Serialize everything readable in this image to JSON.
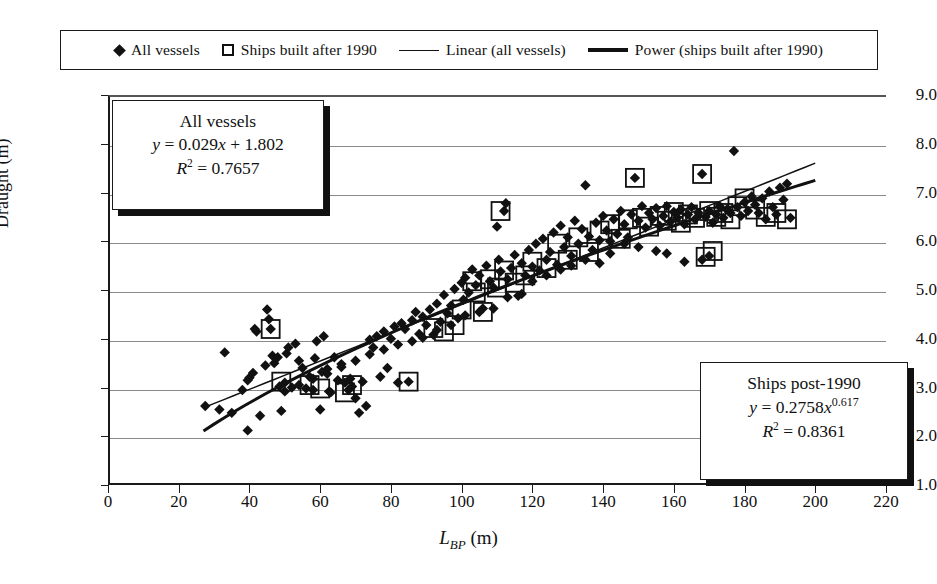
{
  "chart_data": {
    "type": "scatter",
    "title": "",
    "xlabel": "L_BP (m)",
    "xlabel_main": "L",
    "xlabel_sub": "BP",
    "xlabel_unit": " (m)",
    "ylabel": "Draught (m)",
    "xlim": [
      0,
      220
    ],
    "ylim": [
      1.0,
      9.0
    ],
    "xticks": [
      0,
      20,
      40,
      60,
      80,
      100,
      120,
      140,
      160,
      180,
      200,
      220
    ],
    "yticks": [
      "1.0",
      "2.0",
      "3.0",
      "4.0",
      "5.0",
      "6.0",
      "7.0",
      "8.0",
      "9.0"
    ],
    "grid": "horizontal",
    "legend_position": "top",
    "marker_color": "#111111",
    "gridline_color": "#8a8a8a",
    "axis_color": "#1a1a1a",
    "series": [
      {
        "name": "All vessels",
        "marker": "diamond",
        "points": [
          [
            27.5,
            2.62
          ],
          [
            31.5,
            2.55
          ],
          [
            33.0,
            3.72
          ],
          [
            35.0,
            2.48
          ],
          [
            38.0,
            2.95
          ],
          [
            39.5,
            3.15
          ],
          [
            39.5,
            2.12
          ],
          [
            40.0,
            3.2
          ],
          [
            41.0,
            3.3
          ],
          [
            41.5,
            4.2
          ],
          [
            42.0,
            4.15
          ],
          [
            43.0,
            2.42
          ],
          [
            44.5,
            3.45
          ],
          [
            45.0,
            4.6
          ],
          [
            45.5,
            4.4
          ],
          [
            46.0,
            4.2
          ],
          [
            46.5,
            3.65
          ],
          [
            47.0,
            3.5
          ],
          [
            48.0,
            3.62
          ],
          [
            48.5,
            3.02
          ],
          [
            49.0,
            2.52
          ],
          [
            50.0,
            3.1
          ],
          [
            50.5,
            3.7
          ],
          [
            51.0,
            3.82
          ],
          [
            52.0,
            3.0
          ],
          [
            53.0,
            3.9
          ],
          [
            54.0,
            3.55
          ],
          [
            55.0,
            3.4
          ],
          [
            56.0,
            2.98
          ],
          [
            57.0,
            3.22
          ],
          [
            58.0,
            2.95
          ],
          [
            58.5,
            3.6
          ],
          [
            59.0,
            3.95
          ],
          [
            60.0,
            2.55
          ],
          [
            60.5,
            3.32
          ],
          [
            61.0,
            4.05
          ],
          [
            62.0,
            3.38
          ],
          [
            62.5,
            2.92
          ],
          [
            63.0,
            2.9
          ],
          [
            64.0,
            3.62
          ],
          [
            65.0,
            3.15
          ],
          [
            66.0,
            3.48
          ],
          [
            67.0,
            3.1
          ],
          [
            68.0,
            2.95
          ],
          [
            68.5,
            3.18
          ],
          [
            69.0,
            3.02
          ],
          [
            70.0,
            2.78
          ],
          [
            71.0,
            2.48
          ],
          [
            72.0,
            3.12
          ],
          [
            73.0,
            2.62
          ],
          [
            74.0,
            3.98
          ],
          [
            75.0,
            3.82
          ],
          [
            76.0,
            4.05
          ],
          [
            77.0,
            3.22
          ],
          [
            78.0,
            4.15
          ],
          [
            79.0,
            3.4
          ],
          [
            80.0,
            4.0
          ],
          [
            81.0,
            4.25
          ],
          [
            82.0,
            3.1
          ],
          [
            83.0,
            4.32
          ],
          [
            84.0,
            4.2
          ],
          [
            85.0,
            3.12
          ],
          [
            86.0,
            4.38
          ],
          [
            87.0,
            4.55
          ],
          [
            88.0,
            4.1
          ],
          [
            89.0,
            4.45
          ],
          [
            90.0,
            4.28
          ],
          [
            91.0,
            4.6
          ],
          [
            92.0,
            4.08
          ],
          [
            93.0,
            4.72
          ],
          [
            94.0,
            4.35
          ],
          [
            95.0,
            4.9
          ],
          [
            96.0,
            4.52
          ],
          [
            97.0,
            4.68
          ],
          [
            98.0,
            5.02
          ],
          [
            99.0,
            4.42
          ],
          [
            100.0,
            5.15
          ],
          [
            100.5,
            4.8
          ],
          [
            101.0,
            5.25
          ],
          [
            102.0,
            4.95
          ],
          [
            103.0,
            5.42
          ],
          [
            104.0,
            5.1
          ],
          [
            105.0,
            5.3
          ],
          [
            106.0,
            4.62
          ],
          [
            107.0,
            5.5
          ],
          [
            108.0,
            5.18
          ],
          [
            109.0,
            5.05
          ],
          [
            110.0,
            6.3
          ],
          [
            110.5,
            5.62
          ],
          [
            111.0,
            5.38
          ],
          [
            112.0,
            6.62
          ],
          [
            112.5,
            6.78
          ],
          [
            113.0,
            5.22
          ],
          [
            114.0,
            5.45
          ],
          [
            115.0,
            5.72
          ],
          [
            116.0,
            4.88
          ],
          [
            117.0,
            5.55
          ],
          [
            118.0,
            5.3
          ],
          [
            119.0,
            5.82
          ],
          [
            120.0,
            5.48
          ],
          [
            121.0,
            5.95
          ],
          [
            122.0,
            5.4
          ],
          [
            123.0,
            6.05
          ],
          [
            124.0,
            5.62
          ],
          [
            125.0,
            5.78
          ],
          [
            126.0,
            6.18
          ],
          [
            127.0,
            5.52
          ],
          [
            128.0,
            6.32
          ],
          [
            129.0,
            5.88
          ],
          [
            130.0,
            6.08
          ],
          [
            131.0,
            5.7
          ],
          [
            132.0,
            6.42
          ],
          [
            133.0,
            5.95
          ],
          [
            134.0,
            6.25
          ],
          [
            135.0,
            7.15
          ],
          [
            136.0,
            6.1
          ],
          [
            137.0,
            5.82
          ],
          [
            138.0,
            6.38
          ],
          [
            139.0,
            6.02
          ],
          [
            140.0,
            6.52
          ],
          [
            141.0,
            6.22
          ],
          [
            142.0,
            5.75
          ],
          [
            143.0,
            6.45
          ],
          [
            144.0,
            6.15
          ],
          [
            145.0,
            6.62
          ],
          [
            146.0,
            6.35
          ],
          [
            147.0,
            6.08
          ],
          [
            148.0,
            6.55
          ],
          [
            149.0,
            7.3
          ],
          [
            150.0,
            6.42
          ],
          [
            151.0,
            6.72
          ],
          [
            152.0,
            6.28
          ],
          [
            153.0,
            6.58
          ],
          [
            154.0,
            6.45
          ],
          [
            155.0,
            6.68
          ],
          [
            156.0,
            6.32
          ],
          [
            157.0,
            6.52
          ],
          [
            158.0,
            6.72
          ],
          [
            159.0,
            6.4
          ],
          [
            160.0,
            6.6
          ],
          [
            161.0,
            6.48
          ],
          [
            162.0,
            6.65
          ],
          [
            163.0,
            6.35
          ],
          [
            164.0,
            6.55
          ],
          [
            165.0,
            6.7
          ],
          [
            166.0,
            6.45
          ],
          [
            167.0,
            6.58
          ],
          [
            168.0,
            7.38
          ],
          [
            169.0,
            6.5
          ],
          [
            170.0,
            6.62
          ],
          [
            171.0,
            6.38
          ],
          [
            172.0,
            6.55
          ],
          [
            173.0,
            6.72
          ],
          [
            174.0,
            6.48
          ],
          [
            175.0,
            6.65
          ],
          [
            176.0,
            6.58
          ],
          [
            177.0,
            7.85
          ],
          [
            178.0,
            6.7
          ],
          [
            179.0,
            6.52
          ],
          [
            180.0,
            6.8
          ],
          [
            181.0,
            6.62
          ],
          [
            182.0,
            6.92
          ],
          [
            183.0,
            6.75
          ],
          [
            184.0,
            6.58
          ],
          [
            185.0,
            6.88
          ],
          [
            186.0,
            6.45
          ],
          [
            187.0,
            7.02
          ],
          [
            188.0,
            6.7
          ],
          [
            189.0,
            6.55
          ],
          [
            190.0,
            7.1
          ],
          [
            191.0,
            6.85
          ],
          [
            192.0,
            7.18
          ],
          [
            193.0,
            6.48
          ],
          [
            168.0,
            5.62
          ],
          [
            170.0,
            5.7
          ],
          [
            163.0,
            5.58
          ],
          [
            158.0,
            5.75
          ],
          [
            155.0,
            5.8
          ],
          [
            150.0,
            5.88
          ],
          [
            146.0,
            5.95
          ],
          [
            142.0,
            6.0
          ],
          [
            139.0,
            5.55
          ],
          [
            135.0,
            5.62
          ],
          [
            131.0,
            5.5
          ],
          [
            128.0,
            5.42
          ],
          [
            124.0,
            5.3
          ],
          [
            120.0,
            5.18
          ],
          [
            117.0,
            4.92
          ],
          [
            113.0,
            4.85
          ],
          [
            109.0,
            4.62
          ],
          [
            105.0,
            4.55
          ],
          [
            101.0,
            4.48
          ],
          [
            97.0,
            4.28
          ],
          [
            93.0,
            4.18
          ],
          [
            89.0,
            4.02
          ],
          [
            86.0,
            3.95
          ],
          [
            82.0,
            3.88
          ],
          [
            78.0,
            3.78
          ],
          [
            74.0,
            3.68
          ],
          [
            70.0,
            3.55
          ],
          [
            66.0,
            3.42
          ],
          [
            62.0,
            3.28
          ],
          [
            58.0,
            3.18
          ],
          [
            54.0,
            3.05
          ],
          [
            50.0,
            2.92
          ]
        ]
      },
      {
        "name": "Ships built after 1990",
        "marker": "square-outline",
        "points": [
          [
            46.0,
            4.2
          ],
          [
            49.0,
            3.12
          ],
          [
            57.0,
            3.05
          ],
          [
            60.0,
            2.98
          ],
          [
            67.0,
            2.9
          ],
          [
            69.0,
            3.05
          ],
          [
            85.0,
            3.12
          ],
          [
            92.0,
            4.22
          ],
          [
            95.0,
            4.15
          ],
          [
            98.0,
            4.28
          ],
          [
            100.0,
            4.6
          ],
          [
            103.0,
            5.18
          ],
          [
            104.0,
            4.95
          ],
          [
            106.0,
            4.55
          ],
          [
            108.0,
            5.22
          ],
          [
            110.0,
            5.05
          ],
          [
            111.0,
            6.62
          ],
          [
            112.0,
            5.4
          ],
          [
            115.0,
            5.15
          ],
          [
            118.0,
            5.3
          ],
          [
            120.0,
            5.58
          ],
          [
            124.0,
            5.45
          ],
          [
            127.0,
            5.95
          ],
          [
            130.0,
            5.62
          ],
          [
            133.0,
            6.08
          ],
          [
            136.0,
            5.78
          ],
          [
            139.0,
            6.22
          ],
          [
            142.0,
            6.35
          ],
          [
            145.0,
            6.05
          ],
          [
            147.0,
            6.45
          ],
          [
            149.0,
            7.3
          ],
          [
            151.0,
            6.48
          ],
          [
            153.0,
            6.3
          ],
          [
            156.0,
            6.52
          ],
          [
            158.0,
            6.42
          ],
          [
            160.0,
            6.6
          ],
          [
            162.0,
            6.38
          ],
          [
            164.0,
            6.55
          ],
          [
            166.0,
            6.48
          ],
          [
            168.0,
            7.38
          ],
          [
            169.0,
            5.68
          ],
          [
            170.0,
            6.62
          ],
          [
            171.0,
            5.8
          ],
          [
            172.0,
            6.5
          ],
          [
            174.0,
            6.58
          ],
          [
            176.0,
            6.45
          ],
          [
            178.0,
            6.72
          ],
          [
            180.0,
            6.88
          ],
          [
            183.0,
            6.65
          ],
          [
            186.0,
            6.5
          ],
          [
            189.0,
            6.58
          ],
          [
            192.0,
            6.45
          ]
        ]
      }
    ],
    "fits": [
      {
        "name": "Linear (all vessels)",
        "style": "thin",
        "equation": "y = 0.029x + 1.802",
        "r2": "0.7657",
        "slope": 0.029,
        "intercept": 1.802,
        "x_range": [
          27,
          200
        ]
      },
      {
        "name": "Power (ships built after 1990)",
        "style": "thick",
        "equation": "y = 0.2758x^0.617",
        "r2": "0.8361",
        "coefficient": 0.2758,
        "exponent": 0.617,
        "x_range": [
          27,
          200
        ]
      }
    ]
  },
  "legend": {
    "items": [
      {
        "marker": "diamond",
        "label": "All vessels"
      },
      {
        "marker": "square-outline",
        "label": "Ships built after 1990"
      },
      {
        "marker": "line-thin",
        "label": "Linear (all vessels)"
      },
      {
        "marker": "line-thick",
        "label": "Power (ships built after 1990)"
      }
    ]
  },
  "annotations": {
    "all_vessels": {
      "title": "All vessels",
      "eq_y": "y",
      "eq_body": " = 0.029",
      "eq_x": "x",
      "eq_tail": " + 1.802",
      "r_symbol": "R",
      "r_exp": "2",
      "r_value": " = 0.7657"
    },
    "post_1990": {
      "title": "Ships post-1990",
      "eq_y": "y",
      "eq_body": " = 0.2758",
      "eq_x": "x",
      "eq_exp": "0.617",
      "r_symbol": "R",
      "r_exp": "2",
      "r_value": " = 0.8361"
    }
  },
  "axes": {
    "y_title": "Draught (m)",
    "x_title_main": "L",
    "x_title_sub": "BP",
    "x_title_unit": "(m)"
  }
}
